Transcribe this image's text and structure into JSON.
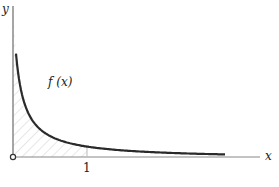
{
  "diagram": {
    "x_axis_label": "x",
    "y_axis_label": "y",
    "curve_label": "f (x)",
    "tick_label": "1",
    "function": "decreasing curve (e.g. 1/x^2 style), shaded area from 0 to 1",
    "shaded_region": "area under f(x) between x = 0 and x = 1",
    "colors": {
      "curve": "#2a2a2a",
      "axis": "#888888",
      "hatch": "#cccccc"
    }
  }
}
